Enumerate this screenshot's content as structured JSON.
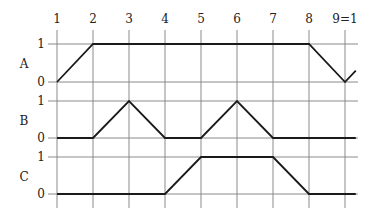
{
  "chart_data": {
    "type": "line",
    "title": "",
    "x_ticks": [
      "1",
      "2",
      "3",
      "4",
      "5",
      "6",
      "7",
      "8",
      "9=1"
    ],
    "x": [
      1,
      2,
      3,
      4,
      5,
      6,
      7,
      8,
      9,
      9.3
    ],
    "series": [
      {
        "name": "A",
        "levels": [
          "0",
          "1"
        ],
        "points": [
          [
            1,
            0
          ],
          [
            2,
            1
          ],
          [
            3,
            1
          ],
          [
            4,
            1
          ],
          [
            5,
            1
          ],
          [
            6,
            1
          ],
          [
            7,
            1
          ],
          [
            8,
            1
          ],
          [
            9,
            0
          ],
          [
            9.3,
            0.3
          ]
        ]
      },
      {
        "name": "B",
        "levels": [
          "0",
          "1"
        ],
        "points": [
          [
            1,
            0
          ],
          [
            2,
            0
          ],
          [
            3,
            1
          ],
          [
            4,
            0
          ],
          [
            5,
            0
          ],
          [
            6,
            1
          ],
          [
            7,
            0
          ],
          [
            8,
            0
          ],
          [
            9,
            0
          ],
          [
            9.3,
            0
          ]
        ]
      },
      {
        "name": "C",
        "levels": [
          "0",
          "1"
        ],
        "points": [
          [
            1,
            0
          ],
          [
            2,
            0
          ],
          [
            3,
            0
          ],
          [
            4,
            0
          ],
          [
            5,
            1
          ],
          [
            6,
            1
          ],
          [
            7,
            1
          ],
          [
            8,
            0
          ],
          [
            9,
            0
          ],
          [
            9.3,
            0
          ]
        ]
      }
    ],
    "grid": true,
    "colors": {
      "grid": "#8a8a8a",
      "trace": "#1a1a1a",
      "text": "#222222"
    }
  }
}
